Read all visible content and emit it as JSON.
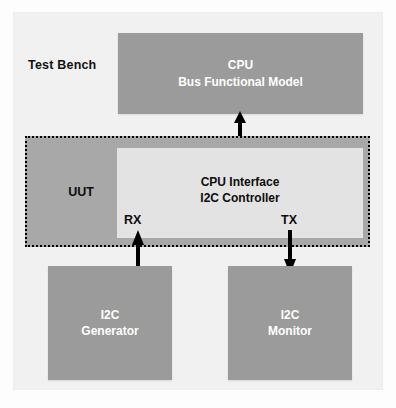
{
  "diagram": {
    "frame_label": "Test Bench",
    "colors": {
      "background": "#f1f1f1",
      "block_dark": "#9b9b9b",
      "block_light": "#e3e3e3",
      "region_fill": "#a8a8a8",
      "border_dashed": "#000000",
      "text_on_dark": "#ffffff",
      "text_on_light": "#0d0d0d",
      "arrow": "#000000"
    },
    "blocks": {
      "cpu_bfm": {
        "line1": "CPU",
        "line2": "Bus Functional Model"
      },
      "uut": {
        "label": "UUT"
      },
      "cpu_interface": {
        "line1": "CPU Interface",
        "line2": "I2C Controller"
      },
      "i2c_generator": {
        "line1": "I2C",
        "line2": "Generator"
      },
      "i2c_monitor": {
        "line1": "I2C",
        "line2": "Monitor"
      }
    },
    "ports": {
      "rx": "RX",
      "tx": "TX"
    },
    "connections": [
      {
        "name": "cpu-bfm-to-cpu-interface",
        "from": "CPU Bus Functional Model",
        "to": "CPU Interface I2C Controller",
        "direction": "bidirectional"
      },
      {
        "name": "i2c-generator-to-rx",
        "from": "I2C Generator",
        "to": "RX",
        "direction": "up"
      },
      {
        "name": "tx-to-i2c-monitor",
        "from": "TX",
        "to": "I2C Monitor",
        "direction": "down"
      }
    ]
  }
}
